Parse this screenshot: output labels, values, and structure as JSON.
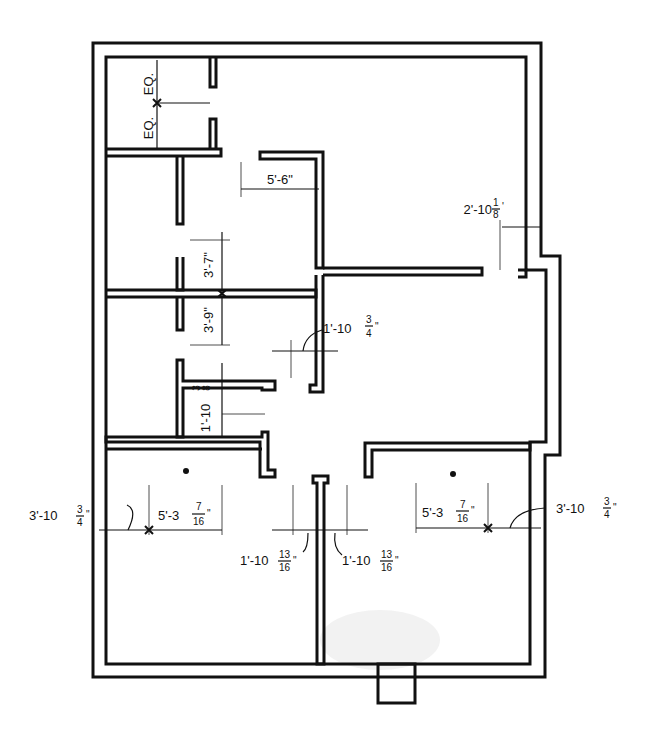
{
  "drawing": {
    "type": "floor-plan",
    "title": "",
    "line_color": "#111111",
    "background": "#ffffff"
  },
  "dimensions": {
    "eq_top": "EQ.",
    "eq_bottom": "EQ.",
    "upper_office_width": "5'-6\"",
    "left_corridor_upper": "3'-7\"",
    "left_corridor_lower": "3'-9\"",
    "closet_depth": {
      "whole": "1'-10",
      "num": "3",
      "den": "8",
      "unit": "\""
    },
    "center_wall_offset": {
      "whole": "1'-10",
      "num": "3",
      "den": "4",
      "unit": "\""
    },
    "right_wall_offset": {
      "whole": "2'-10",
      "num": "1",
      "den": "8",
      "unit": "'"
    },
    "left_outer_offset": {
      "whole": "3'-10",
      "num": "3",
      "den": "4",
      "unit": "\""
    },
    "left_room_width": {
      "whole": "5'-3",
      "num": "7",
      "den": "16",
      "unit": "\""
    },
    "center_left_offset": {
      "whole": "1'-10",
      "num": "13",
      "den": "16",
      "unit": "\""
    },
    "center_right_offset": {
      "whole": "1'-10",
      "num": "13",
      "den": "16",
      "unit": "\""
    },
    "right_room_width": {
      "whole": "5'-3",
      "num": "7",
      "den": "16",
      "unit": "\""
    },
    "right_outer_offset": {
      "whole": "3'-10",
      "num": "3",
      "den": "4",
      "unit": "\""
    }
  },
  "rooms": [
    {
      "id": "top-left-small-room"
    },
    {
      "id": "upper-left-room"
    },
    {
      "id": "middle-left-room"
    },
    {
      "id": "closet"
    },
    {
      "id": "upper-right-hall"
    },
    {
      "id": "lower-left-room"
    },
    {
      "id": "lower-right-room"
    },
    {
      "id": "entry-stoop"
    }
  ]
}
